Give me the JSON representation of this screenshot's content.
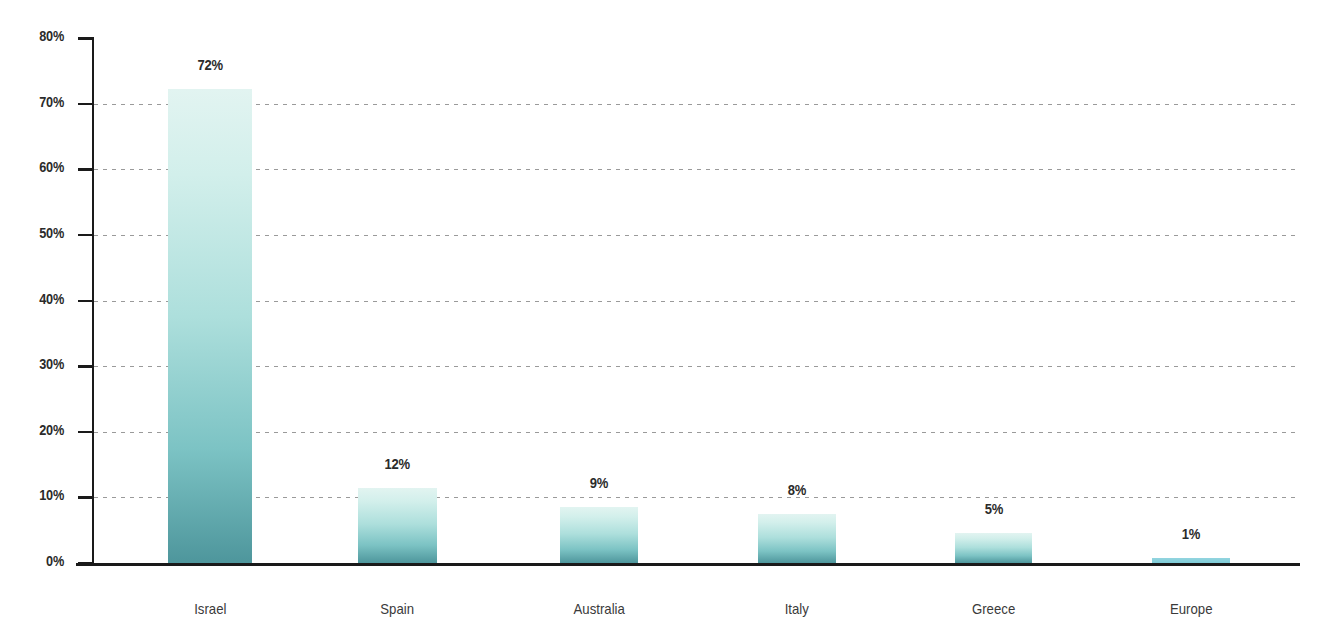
{
  "chart_data": {
    "type": "bar",
    "title": "",
    "subtitle": "",
    "xlabel": "",
    "ylabel": "",
    "categories": [
      "Israel",
      "Spain",
      "Australia",
      "Italy",
      "Greece",
      "Europe"
    ],
    "values": [
      72,
      12,
      9,
      8,
      5,
      1
    ],
    "plotted_values": [
      72.2,
      11.5,
      8.6,
      7.5,
      4.5,
      0.7
    ],
    "data_labels": [
      "72%",
      "12%",
      "9%",
      "8%",
      "5%",
      "1%"
    ],
    "ylim": [
      0,
      80
    ],
    "yticks": [
      0,
      10,
      20,
      30,
      40,
      50,
      60,
      70,
      80
    ],
    "ytick_labels": [
      "0%",
      "10%",
      "20%",
      "30%",
      "40%",
      "50%",
      "60%",
      "70%",
      "80%"
    ],
    "grid": "horizontal-dotted",
    "legend": "none",
    "bar_gradient_top": "#e2f4f1",
    "bar_gradient_bottom": "#4e969c",
    "tiny_bar_color": "#7ecbd6",
    "axis_color": "#1a1a1a",
    "gridline_color": "#9a9a9a",
    "label_color": "#2b2b2b",
    "background": "#ffffff"
  },
  "axis": {
    "y_ticks": [
      {
        "label": "80%",
        "value": 80
      },
      {
        "label": "70%",
        "value": 70
      },
      {
        "label": "60%",
        "value": 60
      },
      {
        "label": "50%",
        "value": 50
      },
      {
        "label": "40%",
        "value": 40
      },
      {
        "label": "30%",
        "value": 30
      },
      {
        "label": "20%",
        "value": 20
      },
      {
        "label": "10%",
        "value": 10
      },
      {
        "label": "0%",
        "value": 0
      }
    ]
  }
}
